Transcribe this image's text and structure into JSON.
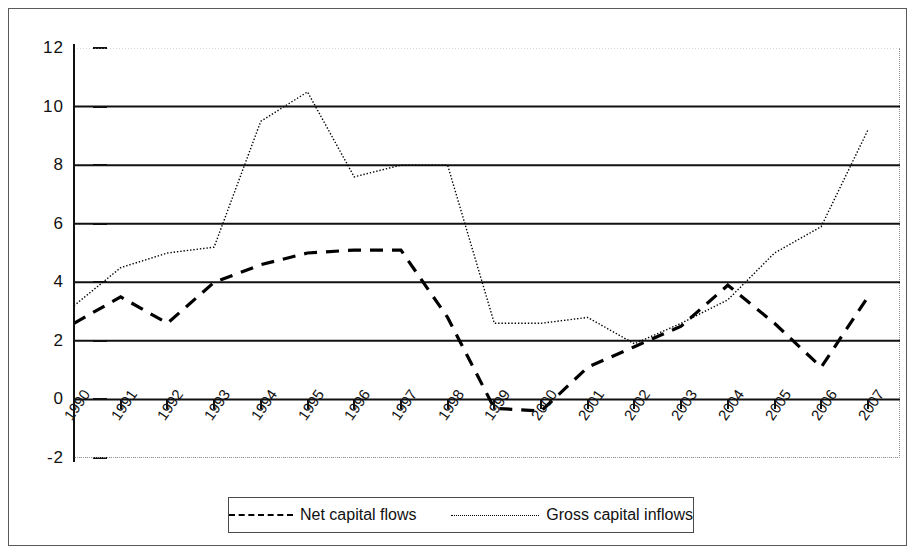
{
  "chart_data": {
    "type": "line",
    "title": "",
    "subtitle": "",
    "xlabel": "",
    "ylabel": "",
    "x": [
      1990,
      1991,
      1992,
      1993,
      1994,
      1995,
      1996,
      1997,
      1998,
      1999,
      2000,
      2001,
      2002,
      2003,
      2004,
      2005,
      2006,
      2007
    ],
    "categories": [
      "1990",
      "1991",
      "1992",
      "1993",
      "1994",
      "1995",
      "1996",
      "1997",
      "1998",
      "1999",
      "2000",
      "2001",
      "2002",
      "2003",
      "2004",
      "2005",
      "2006",
      "2007"
    ],
    "series": [
      {
        "name": "Net capital flows",
        "style": "dashed",
        "color": "#000000",
        "values": [
          2.6,
          3.5,
          2.6,
          4.0,
          4.6,
          5.0,
          5.1,
          5.1,
          2.8,
          -0.3,
          -0.4,
          1.1,
          1.8,
          2.5,
          3.9,
          2.6,
          1.1,
          3.5
        ]
      },
      {
        "name": "Gross capital inflows",
        "style": "dotted",
        "color": "#000000",
        "values": [
          3.2,
          4.5,
          5.0,
          5.2,
          9.5,
          10.5,
          7.6,
          8.0,
          8.0,
          2.6,
          2.6,
          2.8,
          1.9,
          2.6,
          3.4,
          5.0,
          5.9,
          9.2
        ]
      }
    ],
    "ylim": [
      -2,
      12
    ],
    "yticks": [
      12,
      10,
      8,
      6,
      4,
      2,
      0,
      -2
    ],
    "ytick_labels": [
      "12",
      "10",
      "8",
      "6",
      "4",
      "2",
      "0",
      "-2"
    ],
    "xlim": [
      1990,
      2007
    ],
    "grid": true,
    "grid_axis": "y",
    "legend_position": "bottom-center"
  },
  "legend": {
    "entries": [
      {
        "label": "Net capital flows",
        "swatch": "dashed-line-swatch"
      },
      {
        "label": "Gross capital inflows",
        "swatch": "dotted-line-swatch"
      }
    ]
  },
  "axes": {
    "y": {
      "ticks": [
        "12",
        "10",
        "8",
        "6",
        "4",
        "2",
        "0",
        "-2"
      ]
    },
    "x": {
      "ticks": [
        "1990",
        "1991",
        "1992",
        "1993",
        "1994",
        "1995",
        "1996",
        "1997",
        "1998",
        "1999",
        "2000",
        "2001",
        "2002",
        "2003",
        "2004",
        "2005",
        "2006",
        "2007"
      ]
    }
  }
}
